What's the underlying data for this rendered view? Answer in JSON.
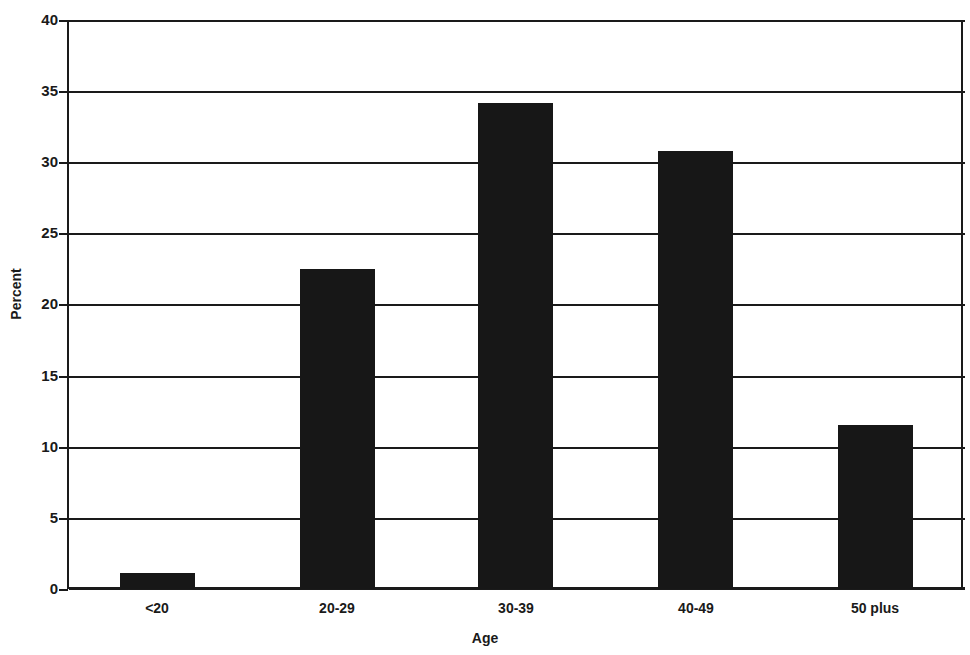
{
  "chart_data": {
    "type": "bar",
    "title": "",
    "xlabel": "Age",
    "ylabel": "Percent",
    "categories": [
      "<20",
      "20-29",
      "30-39",
      "40-49",
      "50 plus"
    ],
    "values": [
      1.1,
      22.6,
      34.3,
      30.9,
      11.6
    ],
    "ylim": [
      0,
      40
    ],
    "ytick_step": 5,
    "yticks": [
      "0",
      "5",
      "10",
      "15",
      "20",
      "25",
      "30",
      "35",
      "40"
    ],
    "ytick_values": [
      0,
      5,
      10,
      15,
      20,
      25,
      30,
      35,
      40
    ],
    "grid": "horizontal",
    "legend": "none",
    "bar_color": "#171717",
    "axis_color": "#1a1a1a",
    "background_color": "#ffffff"
  }
}
